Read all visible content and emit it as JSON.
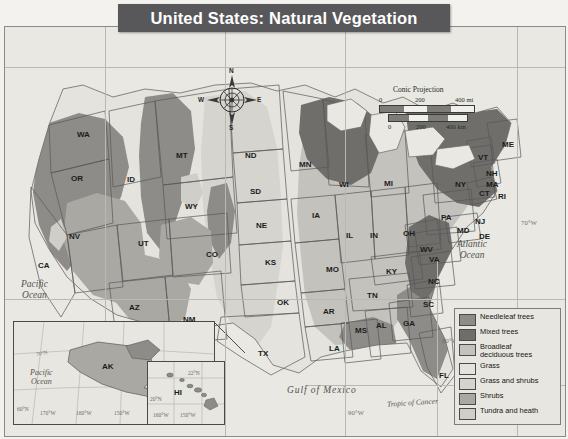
{
  "map": {
    "title": "United States: Natural Vegetation",
    "projection": "Conic Projection"
  },
  "scale": {
    "miles": {
      "t0": "0",
      "t1": "200",
      "t2": "400 mi"
    },
    "km": {
      "t0": "0",
      "t1": "200",
      "t2": "400 km"
    }
  },
  "compass": {
    "n": "N",
    "s": "S",
    "e": "E",
    "w": "W"
  },
  "legend": {
    "items": [
      {
        "label": "Needleleaf trees",
        "color": "#8d8c88"
      },
      {
        "label": "Mixed trees",
        "color": "#6f6e6a"
      },
      {
        "label": "Broadleaf\ndeciduous trees",
        "color": "#c3c2bd"
      },
      {
        "label": "Grass",
        "color": "#e4e3de"
      },
      {
        "label": "Grass and shrubs",
        "color": "#d5d4cf"
      },
      {
        "label": "Shrubs",
        "color": "#a9a8a3"
      },
      {
        "label": "Tundra and heath",
        "color": "#cfcec9"
      }
    ]
  },
  "states": [
    {
      "abbr": "WA",
      "x": 72,
      "y": 103
    },
    {
      "abbr": "OR",
      "x": 66,
      "y": 147
    },
    {
      "abbr": "ID",
      "x": 122,
      "y": 148
    },
    {
      "abbr": "MT",
      "x": 171,
      "y": 124
    },
    {
      "abbr": "WY",
      "x": 180,
      "y": 175
    },
    {
      "abbr": "NV",
      "x": 64,
      "y": 205
    },
    {
      "abbr": "UT",
      "x": 133,
      "y": 212
    },
    {
      "abbr": "CA",
      "x": 33,
      "y": 234
    },
    {
      "abbr": "AZ",
      "x": 124,
      "y": 276
    },
    {
      "abbr": "NM",
      "x": 178,
      "y": 288
    },
    {
      "abbr": "CO",
      "x": 201,
      "y": 223
    },
    {
      "abbr": "ND",
      "x": 240,
      "y": 124
    },
    {
      "abbr": "SD",
      "x": 245,
      "y": 160
    },
    {
      "abbr": "NE",
      "x": 251,
      "y": 194
    },
    {
      "abbr": "KS",
      "x": 260,
      "y": 231
    },
    {
      "abbr": "OK",
      "x": 272,
      "y": 271
    },
    {
      "abbr": "TX",
      "x": 253,
      "y": 322
    },
    {
      "abbr": "MN",
      "x": 294,
      "y": 133
    },
    {
      "abbr": "IA",
      "x": 307,
      "y": 184
    },
    {
      "abbr": "MO",
      "x": 321,
      "y": 238
    },
    {
      "abbr": "AR",
      "x": 318,
      "y": 280
    },
    {
      "abbr": "LA",
      "x": 324,
      "y": 317
    },
    {
      "abbr": "WI",
      "x": 334,
      "y": 153
    },
    {
      "abbr": "IL",
      "x": 341,
      "y": 204
    },
    {
      "abbr": "MS",
      "x": 350,
      "y": 299
    },
    {
      "abbr": "TN",
      "x": 362,
      "y": 264
    },
    {
      "abbr": "KY",
      "x": 381,
      "y": 240
    },
    {
      "abbr": "IN",
      "x": 365,
      "y": 204
    },
    {
      "abbr": "MI",
      "x": 379,
      "y": 152
    },
    {
      "abbr": "OH",
      "x": 398,
      "y": 202
    },
    {
      "abbr": "AL",
      "x": 371,
      "y": 294
    },
    {
      "abbr": "GA",
      "x": 398,
      "y": 292
    },
    {
      "abbr": "FL",
      "x": 434,
      "y": 344
    },
    {
      "abbr": "SC",
      "x": 418,
      "y": 273
    },
    {
      "abbr": "NC",
      "x": 423,
      "y": 250
    },
    {
      "abbr": "VA",
      "x": 424,
      "y": 228
    },
    {
      "abbr": "WV",
      "x": 415,
      "y": 218
    },
    {
      "abbr": "PA",
      "x": 436,
      "y": 186
    },
    {
      "abbr": "NY",
      "x": 450,
      "y": 153
    },
    {
      "abbr": "MD",
      "x": 452,
      "y": 199
    },
    {
      "abbr": "DE",
      "x": 474,
      "y": 205
    },
    {
      "abbr": "NJ",
      "x": 470,
      "y": 190
    },
    {
      "abbr": "CT",
      "x": 474,
      "y": 162
    },
    {
      "abbr": "RI",
      "x": 493,
      "y": 165
    },
    {
      "abbr": "MA",
      "x": 481,
      "y": 153
    },
    {
      "abbr": "NH",
      "x": 481,
      "y": 142
    },
    {
      "abbr": "VT",
      "x": 473,
      "y": 126
    },
    {
      "abbr": "ME",
      "x": 497,
      "y": 113
    }
  ],
  "insets": {
    "alaska": {
      "label": "AK",
      "ocean": "Pacific\nOcean",
      "ticks": [
        "170°W",
        "160°W",
        "150°W",
        "140°W",
        "60°N",
        "70°N"
      ]
    },
    "hawaii": {
      "label": "HI",
      "ticks": [
        "160°W",
        "150°W",
        "20°N",
        "22°N"
      ]
    }
  },
  "features": {
    "pacific": "Pacific\nOcean",
    "atlantic": "Atlantic\nOcean",
    "gulf": "Gulf of Mexico",
    "tropic": "Tropic of Cancer"
  },
  "graticule": {
    "labels": [
      {
        "text": "70°W",
        "x": 516,
        "y": 192
      },
      {
        "text": "80°W",
        "x": 471,
        "y": 297
      },
      {
        "text": "80°W",
        "x": 437,
        "y": 310
      },
      {
        "text": "30°N",
        "x": 519,
        "y": 297
      },
      {
        "text": "90°W",
        "x": 343,
        "y": 382
      }
    ]
  }
}
